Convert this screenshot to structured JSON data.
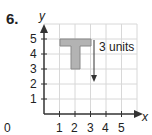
{
  "problem_number": "6.",
  "axes": {
    "x_label": "x",
    "y_label": "y",
    "origin_label": "0",
    "x_ticks": [
      "1",
      "2",
      "3",
      "4",
      "5"
    ],
    "y_ticks": [
      "1",
      "2",
      "3",
      "4",
      "5"
    ]
  },
  "shape": {
    "name": "T",
    "fill": "#b3b3b3",
    "stroke": "#888888"
  },
  "arrow_label": "3 units"
}
